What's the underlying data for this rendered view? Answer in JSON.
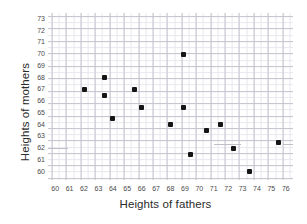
{
  "chart_data": {
    "type": "scatter",
    "title": "",
    "xlabel": "Heights of fathers",
    "ylabel": "Heights of mothers",
    "xlim": [
      59.5,
      76.5
    ],
    "ylim": [
      59.3,
      73.5
    ],
    "xticks": [
      60,
      61,
      62,
      63,
      64,
      65,
      66,
      67,
      68,
      69,
      70,
      71,
      72,
      73,
      74,
      75,
      76
    ],
    "yticks": [
      60,
      61,
      62,
      63,
      64,
      65,
      66,
      67,
      68,
      69,
      70,
      71,
      72,
      73
    ],
    "grid": true,
    "grid_minor": true,
    "legend": "none",
    "marker": {
      "shape": "square",
      "color": "#151515",
      "size": 5
    },
    "x": [
      62.0,
      63.4,
      63.4,
      64.0,
      65.5,
      66.0,
      68.0,
      68.9,
      68.9,
      69.4,
      70.5,
      71.5,
      72.4,
      73.5,
      75.5
    ],
    "y": [
      67.0,
      68.0,
      66.5,
      64.5,
      67.0,
      65.5,
      64.0,
      70.0,
      65.5,
      61.5,
      63.5,
      64.0,
      62.0,
      60.0,
      62.5
    ],
    "points": [
      {
        "x": 62.0,
        "y": 67.0
      },
      {
        "x": 63.4,
        "y": 68.0
      },
      {
        "x": 63.4,
        "y": 66.5
      },
      {
        "x": 64.0,
        "y": 64.5
      },
      {
        "x": 65.5,
        "y": 67.0
      },
      {
        "x": 66.0,
        "y": 65.5
      },
      {
        "x": 68.0,
        "y": 64.0
      },
      {
        "x": 68.9,
        "y": 70.0
      },
      {
        "x": 68.9,
        "y": 65.5
      },
      {
        "x": 69.4,
        "y": 61.5
      },
      {
        "x": 70.5,
        "y": 63.5
      },
      {
        "x": 71.5,
        "y": 64.0
      },
      {
        "x": 72.4,
        "y": 62.0
      },
      {
        "x": 73.5,
        "y": 60.0
      },
      {
        "x": 75.5,
        "y": 62.5
      }
    ],
    "artifacts": [
      {
        "x0": 59.5,
        "x1": 60.9,
        "y": 62.0
      },
      {
        "x0": 71.0,
        "x1": 72.9,
        "y": 62.4
      },
      {
        "x0": 75.8,
        "x1": 76.5,
        "y": 62.4
      }
    ]
  },
  "colors": {
    "marker": "#151515",
    "grid_minor": "#e8e8ee",
    "grid_major": "#c4c4cf",
    "tick_text": "#4a4a4a",
    "axis_title": "#2b2b2b",
    "background": "#ffffff"
  }
}
